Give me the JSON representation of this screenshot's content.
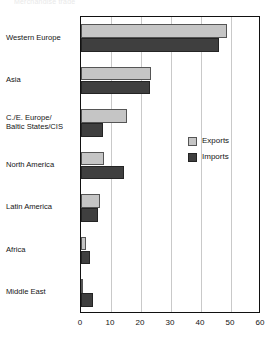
{
  "title_fragment": "Merchandise trade",
  "chart_data": {
    "type": "bar",
    "orientation": "horizontal",
    "title": "",
    "xlabel": "",
    "ylabel": "",
    "xlim": [
      0,
      60
    ],
    "xticks": [
      0,
      10,
      20,
      30,
      40,
      50,
      60
    ],
    "grid": "vertical",
    "legend_position": "inside-right-middle",
    "categories": [
      "Western Europe",
      "Asia",
      "C./E. Europe/\nBaltic States/CIS",
      "North America",
      "Latin America",
      "Africa",
      "Middle East"
    ],
    "category_lines": [
      [
        "Western Europe"
      ],
      [
        "Asia"
      ],
      [
        "C./E. Europe/",
        "Baltic States/CIS"
      ],
      [
        "North America"
      ],
      [
        "Latin America"
      ],
      [
        "Africa"
      ],
      [
        "Middle East"
      ]
    ],
    "series": [
      {
        "name": "Exports",
        "color": "#c5c5c5",
        "values": [
          48.7,
          23.3,
          15.3,
          7.7,
          6.3,
          1.7,
          0.7
        ]
      },
      {
        "name": "Imports",
        "color": "#3f3f3f",
        "values": [
          46.0,
          23.0,
          7.3,
          14.3,
          5.7,
          3.0,
          4.0
        ]
      }
    ]
  },
  "legend": {
    "entries": [
      {
        "label": "Exports",
        "swatch": "exports"
      },
      {
        "label": "Imports",
        "swatch": "imports"
      }
    ]
  }
}
